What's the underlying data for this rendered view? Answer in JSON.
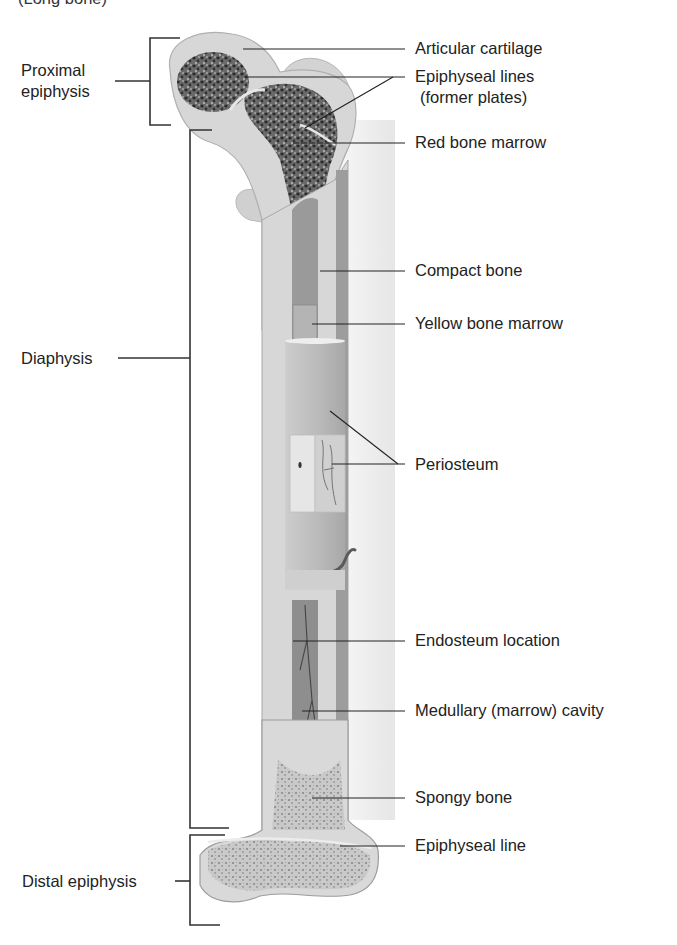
{
  "figure": {
    "title_partial": "(Long bone)",
    "colors": {
      "background": "#ffffff",
      "shade_column": "#ececec",
      "bone_outer": "#cfcfcf",
      "cartilage": "#e4e4e4",
      "spongy_dark": "#3a3a3a",
      "spongy_light": "#9a9a9a",
      "compact": "#bdbdbd",
      "marrow_cavity": "#8e8e8e",
      "leader_line": "#222222"
    }
  },
  "regions": {
    "proximal_epiphysis": "Proximal\nepiphysis",
    "proximal_line1": "Proximal",
    "proximal_line2": "epiphysis",
    "diaphysis": "Diaphysis",
    "distal_epiphysis": "Distal epiphysis"
  },
  "labels": [
    {
      "id": "articular-cartilage",
      "text": "Articular cartilage"
    },
    {
      "id": "epiphyseal-lines",
      "text": "Epiphyseal lines"
    },
    {
      "id": "epiphyseal-lines-sub",
      "text": "(former plates)"
    },
    {
      "id": "red-bone-marrow",
      "text": "Red bone marrow"
    },
    {
      "id": "compact-bone",
      "text": "Compact bone"
    },
    {
      "id": "yellow-bone-marrow",
      "text": "Yellow bone marrow"
    },
    {
      "id": "periosteum",
      "text": "Periosteum"
    },
    {
      "id": "endosteum-location",
      "text": "Endosteum location"
    },
    {
      "id": "medullary-cavity",
      "text": "Medullary (marrow) cavity"
    },
    {
      "id": "spongy-bone",
      "text": "Spongy bone"
    },
    {
      "id": "epiphyseal-line",
      "text": "Epiphyseal line"
    }
  ]
}
